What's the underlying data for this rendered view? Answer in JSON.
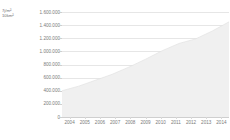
{
  "chart_data": {
    "type": "area",
    "title": "",
    "subtitle": "",
    "xlabel": "",
    "ylabel_lines": [
      "7j/m²",
      "10km²"
    ],
    "categories": [
      "2004",
      "2005",
      "2006",
      "2007",
      "2008",
      "2009",
      "2010",
      "2011",
      "2012",
      "2013",
      "2014"
    ],
    "x": [
      2004,
      2005,
      2006,
      2007,
      2008,
      2009,
      2010,
      2011,
      2012,
      2013,
      2014
    ],
    "series": [
      {
        "name": "",
        "values": [
          400000,
          470000,
          560000,
          650000,
          760000,
          880000,
          1010000,
          1120000,
          1190000,
          1310000,
          1450000
        ]
      }
    ],
    "ylim": [
      0,
      1600000
    ],
    "ytick_values": [
      1600000,
      1400000,
      1200000,
      1000000,
      800000,
      600000,
      400000,
      200000,
      0
    ],
    "ytick_labels": [
      "1.600.000",
      "1.400.000",
      "1.200.000",
      "1.000.000",
      "800.000",
      "600.000",
      "400.000",
      "200.000",
      "0"
    ],
    "xtick_labels": [
      "2004",
      "2005",
      "2006",
      "2007",
      "2008",
      "2009",
      "2010",
      "2011",
      "2012",
      "2013",
      "2014"
    ],
    "grid": "horizontal",
    "legend": "none",
    "colors": {
      "area_fill": "#f0f0f0",
      "area_stroke": "#e3e3e3",
      "gridline": "#e6e6e6",
      "axis": "#cfcfcf",
      "tick_text": "#7a7a7a",
      "unit_text": "#6e6e6e",
      "background": "#ffffff"
    }
  }
}
